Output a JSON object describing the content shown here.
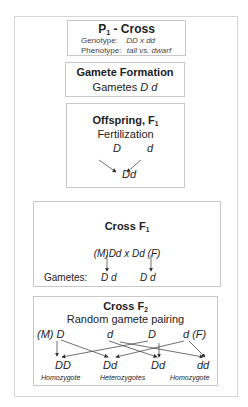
{
  "p1_cross": {
    "title": "P",
    "title_sub": "1",
    "title_rest": " -  Cross",
    "genotype_label": "Genotype:",
    "genotype_value": "DD  x  dd",
    "phenotype_label": "Phenotype:",
    "phenotype_value": "tall  vs. dwarf"
  },
  "gamete_formation": {
    "title": "Gamete Formation",
    "label": "Gametes",
    "gametes": "D  d"
  },
  "offspring_f1": {
    "title": "Offspring,   F",
    "title_sub": "1",
    "subtitle": "Fertilization",
    "gamete_left": "D",
    "gamete_right": "d",
    "result": "Dd"
  },
  "cross_f1": {
    "title": "Cross    F",
    "title_sub": "1",
    "parents": "(M)Dd   x   Dd (F)",
    "gametes_label": "Gametes:",
    "gametes_m": "D  d",
    "gametes_f": "D  d"
  },
  "cross_f2": {
    "title": "Cross  F",
    "title_sub": "2",
    "subtitle": "Random gamete pairing",
    "gametes": [
      "(M) D",
      "d",
      "D",
      "d  (F)"
    ],
    "offspring": [
      "DD",
      "Dd",
      "Dd",
      "dd"
    ],
    "labels": [
      "Homozygote",
      "Heterozygotes",
      "Homozygote"
    ]
  },
  "colors": {
    "border": "#c8c8c8",
    "arrow": "#333333"
  }
}
